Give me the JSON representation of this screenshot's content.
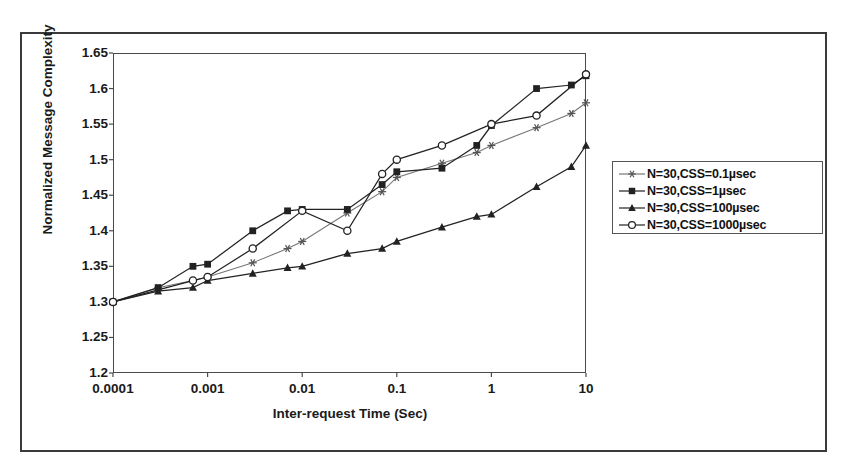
{
  "figure": {
    "frame_color": "#3a3a3a",
    "plot_border_color": "#4a4a4a",
    "background": "#ffffff",
    "line_color": "#222222"
  },
  "chart_data": {
    "type": "line",
    "title": "",
    "xlabel": "Inter-request Time (Sec)",
    "ylabel": "Normalized Message Complexity",
    "xscale": "log",
    "xlim": [
      0.0001,
      10
    ],
    "ylim": [
      1.2,
      1.65
    ],
    "yticks": [
      "1.2",
      "1.25",
      "1.3",
      "1.35",
      "1.4",
      "1.45",
      "1.5",
      "1.55",
      "1.6",
      "1.65"
    ],
    "ytick_values": [
      1.2,
      1.25,
      1.3,
      1.35,
      1.4,
      1.45,
      1.5,
      1.55,
      1.6,
      1.65
    ],
    "xticks": [
      "0.0001",
      "0.001",
      "0.01",
      "0.1",
      "1",
      "10"
    ],
    "xtick_values": [
      0.0001,
      0.001,
      0.01,
      0.1,
      1,
      10
    ],
    "grid": false,
    "legend_position": "right-outside",
    "series": [
      {
        "name": "N=30,CSS=0.1µsec",
        "marker": "star",
        "color": "#222222",
        "x": [
          0.0001,
          0.0003,
          0.0007,
          0.001,
          0.003,
          0.007,
          0.01,
          0.03,
          0.07,
          0.1,
          0.3,
          0.7,
          1,
          3,
          7,
          10
        ],
        "y": [
          1.3,
          1.32,
          1.33,
          1.335,
          1.355,
          1.375,
          1.385,
          1.425,
          1.455,
          1.475,
          1.495,
          1.51,
          1.52,
          1.545,
          1.565,
          1.58
        ]
      },
      {
        "name": "N=30,CSS=1µsec",
        "marker": "square-filled",
        "color": "#222222",
        "x": [
          0.0001,
          0.0003,
          0.0007,
          0.001,
          0.003,
          0.007,
          0.01,
          0.03,
          0.07,
          0.1,
          0.3,
          0.7,
          1,
          3,
          7,
          10
        ],
        "y": [
          1.3,
          1.32,
          1.35,
          1.353,
          1.4,
          1.428,
          1.43,
          1.43,
          1.465,
          1.483,
          1.488,
          1.52,
          1.548,
          1.6,
          1.605,
          1.618
        ]
      },
      {
        "name": "N=30,CSS=100µsec",
        "marker": "triangle-filled",
        "color": "#222222",
        "x": [
          0.0001,
          0.0003,
          0.0007,
          0.001,
          0.003,
          0.007,
          0.01,
          0.03,
          0.07,
          0.1,
          0.3,
          0.7,
          1,
          3,
          7,
          10
        ],
        "y": [
          1.3,
          1.315,
          1.32,
          1.33,
          1.34,
          1.348,
          1.35,
          1.368,
          1.375,
          1.385,
          1.405,
          1.42,
          1.423,
          1.462,
          1.49,
          1.52
        ]
      },
      {
        "name": "N=30,CSS=1000µsec",
        "marker": "circle-open",
        "color": "#222222",
        "x": [
          0.0001,
          0.0007,
          0.001,
          0.003,
          0.01,
          0.03,
          0.07,
          0.1,
          0.3,
          1,
          3,
          10
        ],
        "y": [
          1.3,
          1.33,
          1.335,
          1.375,
          1.428,
          1.4,
          1.48,
          1.5,
          1.52,
          1.55,
          1.562,
          1.62
        ]
      }
    ]
  },
  "legend": {
    "entries": [
      {
        "label": "N=30,CSS=0.1µsec",
        "marker": "star"
      },
      {
        "label": "N=30,CSS=1µsec",
        "marker": "square-filled"
      },
      {
        "label": "N=30,CSS=100µsec",
        "marker": "triangle-filled"
      },
      {
        "label": "N=30,CSS=1000µsec",
        "marker": "circle-open"
      }
    ]
  }
}
